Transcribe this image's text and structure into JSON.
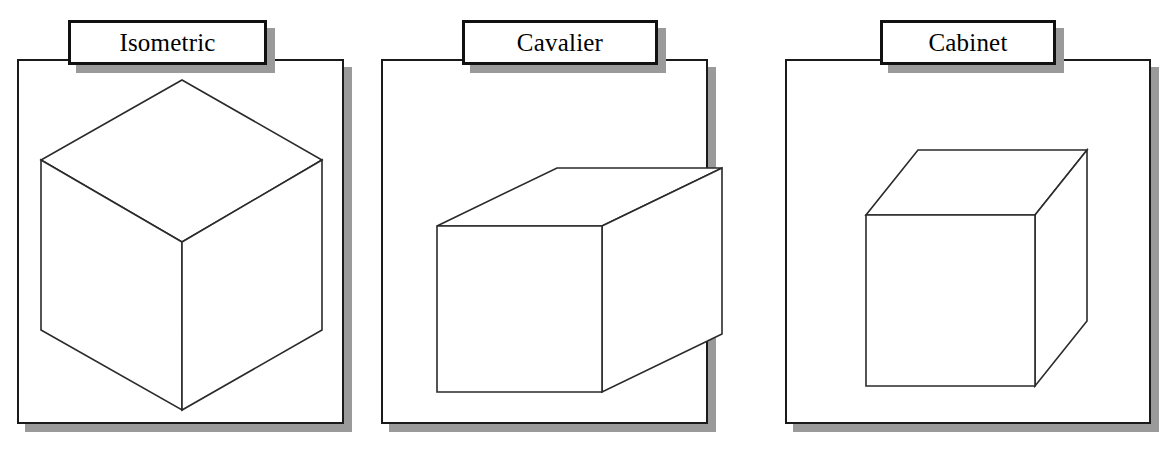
{
  "figure": {
    "background_color": "#ffffff",
    "line_color": "#2a2a2a",
    "shadow_color": "#9a9a9a",
    "border_color": "#1a1a1a"
  },
  "panels": [
    {
      "id": "isometric",
      "label": "Isometric",
      "frame": {
        "x": 17,
        "y": 59,
        "w": 327,
        "h": 365
      },
      "shadow": {
        "x": 25,
        "y": 67,
        "w": 327,
        "h": 365
      },
      "label_box": {
        "x": 68,
        "y": 20,
        "w": 199,
        "h": 45
      },
      "cube": {
        "projection_type": "isometric",
        "description": "Cube drawn with all three axes at equal 120 degree separation; top face is a rhombus, two side faces visible, vertical center edge.",
        "top_apex": {
          "x": 182,
          "y": 80
        },
        "left": {
          "x": 41,
          "y": 160
        },
        "right": {
          "x": 322,
          "y": 160
        },
        "center": {
          "x": 182,
          "y": 242
        },
        "bottom_left": {
          "x": 41,
          "y": 330
        },
        "bottom_right": {
          "x": 322,
          "y": 330
        },
        "bottom_apex": {
          "x": 182,
          "y": 410
        }
      }
    },
    {
      "id": "cavalier",
      "label": "Cavalier",
      "frame": {
        "x": 381,
        "y": 59,
        "w": 327,
        "h": 365
      },
      "shadow": {
        "x": 389,
        "y": 67,
        "w": 327,
        "h": 365
      },
      "label_box": {
        "x": 462,
        "y": 20,
        "w": 196,
        "h": 45
      },
      "cube": {
        "projection_type": "oblique-cavalier",
        "description": "Oblique projection with receding axis at 45 degrees drawn at full scale (1:1 depth ratio), producing an elongated box.",
        "front_face": {
          "left": 437,
          "right": 602,
          "top": 226,
          "bottom": 392
        },
        "depth_dx": 120,
        "depth_dy": -58,
        "depth_ratio": 1.0
      }
    },
    {
      "id": "cabinet",
      "label": "Cabinet",
      "frame": {
        "x": 785,
        "y": 59,
        "w": 366,
        "h": 365
      },
      "shadow": {
        "x": 793,
        "y": 67,
        "w": 366,
        "h": 365
      },
      "label_box": {
        "x": 880,
        "y": 20,
        "w": 176,
        "h": 45
      },
      "cube": {
        "projection_type": "oblique-cabinet",
        "description": "Oblique projection with receding axis at 45 degrees drawn at half scale (1:2 depth ratio), giving a more natural cube-like appearance.",
        "front_face": {
          "left": 866,
          "right": 1035,
          "top": 215,
          "bottom": 386
        },
        "depth_dx": 52,
        "depth_dy": -65,
        "depth_ratio": 0.5
      }
    }
  ]
}
